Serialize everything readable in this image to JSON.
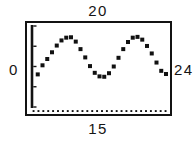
{
  "figure": {
    "type": "scatter-plot-thumbnail",
    "background_color": "#ffffff",
    "frame_color": "#131313",
    "marker_color": "#111111"
  },
  "labels": {
    "top": "20",
    "bottom": "15",
    "left": "0",
    "right": "24"
  },
  "chart_data": {
    "type": "scatter",
    "title": "",
    "subtitle": "",
    "xlabel": "15",
    "ylabel": "0",
    "annotations": [
      {
        "position": "top",
        "text": "20"
      },
      {
        "position": "bottom",
        "text": "15"
      },
      {
        "position": "left",
        "text": "0"
      },
      {
        "position": "right",
        "text": "24"
      }
    ],
    "grid": false,
    "legend": false,
    "legend_position": "none",
    "xlim": [
      0,
      28
    ],
    "ylim": [
      0,
      20
    ],
    "axis_style": {
      "left_axis": "solid-thick-with-ticks",
      "bottom_axis": "dotted",
      "left_tick_count": 5,
      "bottom_dot_count": 28
    },
    "marker": "square",
    "marker_size": 4,
    "x": [
      1,
      2,
      3,
      4,
      5,
      6,
      7,
      8,
      9,
      10,
      11,
      12,
      13,
      14,
      15,
      16,
      17,
      18,
      19,
      20,
      21,
      22,
      23,
      24,
      25,
      26,
      27,
      28
    ],
    "y": [
      8.0,
      10.3,
      11.9,
      13.6,
      15.3,
      16.6,
      17.3,
      17.4,
      16.3,
      14.4,
      12.3,
      10.1,
      8.4,
      7.5,
      7.4,
      8.3,
      10.0,
      12.2,
      14.4,
      16.2,
      17.3,
      17.5,
      16.8,
      15.2,
      13.3,
      11.0,
      8.9,
      8.1
    ],
    "series": [
      {
        "name": "series-1",
        "values": [
          8.0,
          10.3,
          11.9,
          13.6,
          15.3,
          16.6,
          17.3,
          17.4,
          16.3,
          14.4,
          12.3,
          10.1,
          8.4,
          7.5,
          7.4,
          8.3,
          10.0,
          12.2,
          14.4,
          16.2,
          17.3,
          17.5,
          16.8,
          15.2,
          13.3,
          11.0,
          8.9,
          8.1
        ]
      }
    ]
  }
}
